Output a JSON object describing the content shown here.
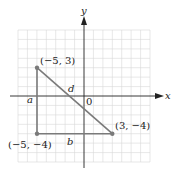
{
  "diagram": {
    "axes": {
      "x_label": "x",
      "y_label": "y",
      "origin_label": "0"
    },
    "grid": {
      "xmin": -7,
      "xmax": 7,
      "ymin": -7,
      "ymax": 7
    },
    "points": [
      {
        "label": "(−5, 3)",
        "x": -5,
        "y": 3
      },
      {
        "label": "(3, −4)",
        "x": 3,
        "y": -4
      },
      {
        "label": "(−5, −4)",
        "x": -5,
        "y": -4
      }
    ],
    "segments": [
      {
        "label": "a",
        "from": [
          -5,
          3
        ],
        "to": [
          -5,
          -4
        ]
      },
      {
        "label": "b",
        "from": [
          -5,
          -4
        ],
        "to": [
          3,
          -4
        ]
      },
      {
        "label": "d",
        "from": [
          -5,
          3
        ],
        "to": [
          3,
          -4
        ]
      }
    ],
    "colors": {
      "triangle": "#7a7a7a",
      "grid": "#d4d4d4",
      "axis": "#222222"
    }
  }
}
